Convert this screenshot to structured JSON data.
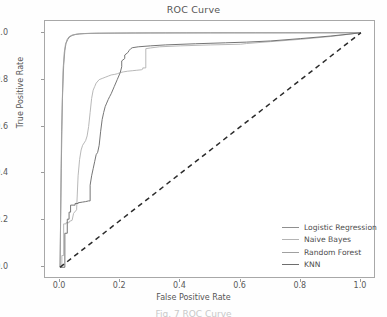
{
  "chart_data": {
    "type": "line",
    "title": "ROC Curve",
    "xlabel": "False Positive Rate",
    "ylabel": "True Positive Rate",
    "xlim": [
      -0.05,
      1.05
    ],
    "ylim": [
      -0.05,
      1.05
    ],
    "xticks": [
      "0.0",
      "0.2",
      "0.4",
      "0.6",
      "0.8",
      "1.0"
    ],
    "xtick_values": [
      0.0,
      0.2,
      0.4,
      0.6,
      0.8,
      1.0
    ],
    "yticks": [
      "0.0",
      "0.2",
      "0.4",
      "0.6",
      "0.8",
      "1.0"
    ],
    "ytick_values": [
      0.0,
      0.2,
      0.4,
      0.6,
      0.8,
      1.0
    ],
    "grid": false,
    "legend_position": "lower right",
    "series": [
      {
        "name": "Logistic Regression",
        "color": "#8f8f8f",
        "linestyle": "solid",
        "x": [
          0.0,
          0.004,
          0.008,
          0.012,
          0.016,
          0.02,
          0.026,
          0.032,
          0.04,
          0.05,
          0.065,
          0.08,
          0.1,
          0.13,
          0.18,
          0.25,
          0.35,
          0.5,
          0.65,
          0.8,
          0.9,
          0.96,
          1.0
        ],
        "y": [
          0.0,
          0.42,
          0.72,
          0.86,
          0.925,
          0.955,
          0.972,
          0.982,
          0.988,
          0.992,
          0.995,
          0.9965,
          0.9975,
          0.998,
          0.9985,
          0.999,
          0.9992,
          0.9995,
          0.9996,
          0.9998,
          0.9999,
          1.0,
          1.0
        ]
      },
      {
        "name": "Naive Bayes",
        "color": "#b4b4b4",
        "linestyle": "solid",
        "x": [
          0.0,
          0.006,
          0.006,
          0.012,
          0.012,
          0.02,
          0.02,
          0.03,
          0.03,
          0.04,
          0.045,
          0.055,
          0.06,
          0.065,
          0.07,
          0.075,
          0.08,
          0.085,
          0.09,
          0.095,
          0.1,
          0.105,
          0.11,
          0.115,
          0.12,
          0.13,
          0.14,
          0.15,
          0.16,
          0.17,
          0.18,
          0.19,
          0.2,
          0.21,
          0.225,
          0.24,
          0.255,
          0.27,
          0.275,
          0.275,
          0.285,
          0.285,
          0.3,
          0.33,
          0.4,
          0.5,
          0.6,
          0.62,
          0.7,
          0.8,
          0.9,
          0.95,
          0.98,
          1.0
        ],
        "y": [
          0.0,
          0.0,
          0.05,
          0.05,
          0.185,
          0.185,
          0.19,
          0.19,
          0.195,
          0.2,
          0.23,
          0.245,
          0.39,
          0.46,
          0.5,
          0.52,
          0.53,
          0.54,
          0.56,
          0.6,
          0.66,
          0.72,
          0.755,
          0.77,
          0.785,
          0.8,
          0.805,
          0.81,
          0.815,
          0.82,
          0.822,
          0.825,
          0.83,
          0.833,
          0.836,
          0.838,
          0.84,
          0.842,
          0.845,
          0.85,
          0.85,
          0.932,
          0.935,
          0.94,
          0.944,
          0.948,
          0.951,
          0.954,
          0.962,
          0.972,
          0.984,
          0.992,
          0.997,
          1.0
        ]
      },
      {
        "name": "Random Forest",
        "color": "#a0a0a0",
        "linestyle": "solid",
        "x": [
          0.0,
          0.005,
          0.01,
          0.014,
          0.018,
          0.024,
          0.03,
          0.04,
          0.055,
          0.07,
          0.09,
          0.12,
          0.16,
          0.22,
          0.3,
          0.42,
          0.58,
          0.75,
          0.88,
          0.95,
          1.0
        ],
        "y": [
          0.0,
          0.58,
          0.84,
          0.915,
          0.95,
          0.972,
          0.983,
          0.99,
          0.994,
          0.9955,
          0.9965,
          0.9975,
          0.998,
          0.9985,
          0.999,
          0.9993,
          0.9995,
          0.9997,
          0.9998,
          0.9999,
          1.0
        ]
      },
      {
        "name": "KNN",
        "color": "#6e6e6e",
        "linestyle": "solid",
        "x": [
          0.0,
          0.016,
          0.016,
          0.024,
          0.024,
          0.03,
          0.03,
          0.035,
          0.035,
          0.05,
          0.05,
          0.06,
          0.06,
          0.075,
          0.085,
          0.095,
          0.1,
          0.1,
          0.105,
          0.11,
          0.115,
          0.12,
          0.125,
          0.13,
          0.135,
          0.14,
          0.145,
          0.15,
          0.155,
          0.16,
          0.165,
          0.17,
          0.18,
          0.19,
          0.2,
          0.205,
          0.205,
          0.215,
          0.215,
          0.225,
          0.23,
          0.235,
          0.24,
          0.26,
          0.3,
          0.35,
          0.45,
          0.55,
          0.62,
          0.7,
          0.8,
          0.9,
          0.96,
          1.0
        ],
        "y": [
          0.0,
          0.0,
          0.145,
          0.145,
          0.205,
          0.205,
          0.235,
          0.235,
          0.265,
          0.265,
          0.272,
          0.272,
          0.275,
          0.278,
          0.28,
          0.283,
          0.283,
          0.35,
          0.39,
          0.42,
          0.45,
          0.48,
          0.49,
          0.52,
          0.58,
          0.63,
          0.66,
          0.685,
          0.7,
          0.715,
          0.728,
          0.74,
          0.77,
          0.8,
          0.83,
          0.855,
          0.88,
          0.89,
          0.905,
          0.915,
          0.925,
          0.932,
          0.936,
          0.94,
          0.944,
          0.948,
          0.953,
          0.957,
          0.96,
          0.965,
          0.975,
          0.986,
          0.994,
          1.0
        ]
      },
      {
        "name": "Chance",
        "color": "#2b2b2b",
        "linestyle": "dashed",
        "x": [
          0.0,
          1.0
        ],
        "y": [
          0.0,
          1.0
        ]
      }
    ]
  },
  "legend": {
    "entries": [
      {
        "label": "Logistic Regression"
      },
      {
        "label": "Naive Bayes"
      },
      {
        "label": "Random Forest"
      },
      {
        "label": "KNN"
      }
    ]
  },
  "caption": {
    "text": "Fig. 7  ROC Curve"
  }
}
